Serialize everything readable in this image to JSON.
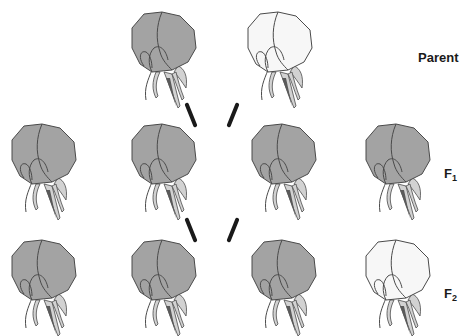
{
  "colors": {
    "colored_petal": "#a3a3a3",
    "colored_petal_inner": "#9a9a9a",
    "white_petal": "#f7f7f7",
    "outline": "#4a4a4a",
    "sepal": "#d2d2d2",
    "pistil_dark": "#5a5a5a",
    "cross_line": "#1a1a1a",
    "background": "#ffffff"
  },
  "rows": [
    {
      "id": "parent",
      "label": "Parent",
      "label_sub": "",
      "flowers": [
        {
          "phenotype": "colored"
        },
        {
          "phenotype": "white"
        }
      ]
    },
    {
      "id": "f1",
      "label": "F",
      "label_sub": "1",
      "flowers": [
        {
          "phenotype": "colored"
        },
        {
          "phenotype": "colored"
        },
        {
          "phenotype": "colored"
        },
        {
          "phenotype": "colored"
        }
      ]
    },
    {
      "id": "f2",
      "label": "F",
      "label_sub": "2",
      "flowers": [
        {
          "phenotype": "colored"
        },
        {
          "phenotype": "colored"
        },
        {
          "phenotype": "colored"
        },
        {
          "phenotype": "white"
        }
      ]
    }
  ]
}
